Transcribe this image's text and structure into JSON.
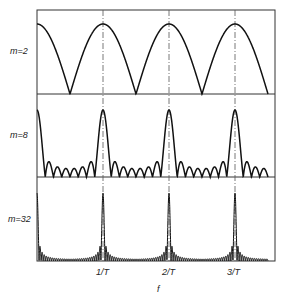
{
  "chart_data": {
    "type": "line",
    "title": "",
    "xlabel": "f",
    "ylabel": "",
    "x_ticks": [
      {
        "label": "1/T",
        "value": 1
      },
      {
        "label": "2/T",
        "value": 2
      },
      {
        "label": "3/T",
        "value": 3
      }
    ],
    "xlim": [
      0,
      3.5
    ],
    "grid": "dash-dot vertical lines at 1/T, 2/T, 3/T",
    "panels": [
      {
        "label": "m=2",
        "m": 2,
        "function": "|sin(m*pi*f*T)/(m*sin(pi*f*T))|",
        "peak_positions": [
          0,
          1,
          2,
          3
        ],
        "sidelobes_between_peaks": 1
      },
      {
        "label": "m=8",
        "m": 8,
        "function": "|sin(m*pi*f*T)/(m*sin(pi*f*T))|",
        "peak_positions": [
          0,
          1,
          2,
          3
        ],
        "sidelobes_between_peaks": 7
      },
      {
        "label": "m=32",
        "m": 32,
        "function": "|sin(m*pi*f*T)/(m*sin(pi*f*T))|",
        "peak_positions": [
          0,
          1,
          2,
          3
        ],
        "sidelobes_between_peaks": 31
      }
    ]
  },
  "labels": {
    "panel_0": "m=2",
    "panel_1": "m=8",
    "panel_2": "m=32",
    "tick_1": "1/T",
    "tick_2": "2/T",
    "tick_3": "3/T",
    "xaxis": "f"
  }
}
